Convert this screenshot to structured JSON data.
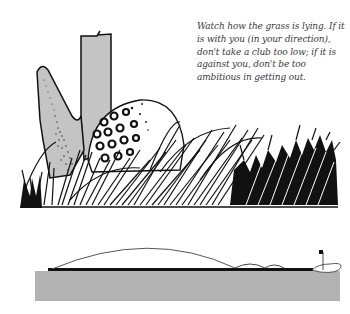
{
  "caption": {
    "lines": [
      "Watch how the grass is lying. If it",
      "is with you (in your direction),",
      "don't take a club too low; if it is",
      "against you, don't be too",
      "ambitious in getting out."
    ]
  },
  "illustration": {
    "subject": "golf-club-and-ball-in-rough",
    "club_color": "#c4c4c4",
    "ball_color": "#ffffff",
    "grass_color": "#000000"
  },
  "diagram": {
    "ground_color": "#b3b3b3",
    "fairway_line_color": "#111111",
    "trajectory_color": "#555555",
    "flag_color": "#111111"
  },
  "colors": {
    "background": "#ffffff",
    "text": "#3a3a3a"
  }
}
